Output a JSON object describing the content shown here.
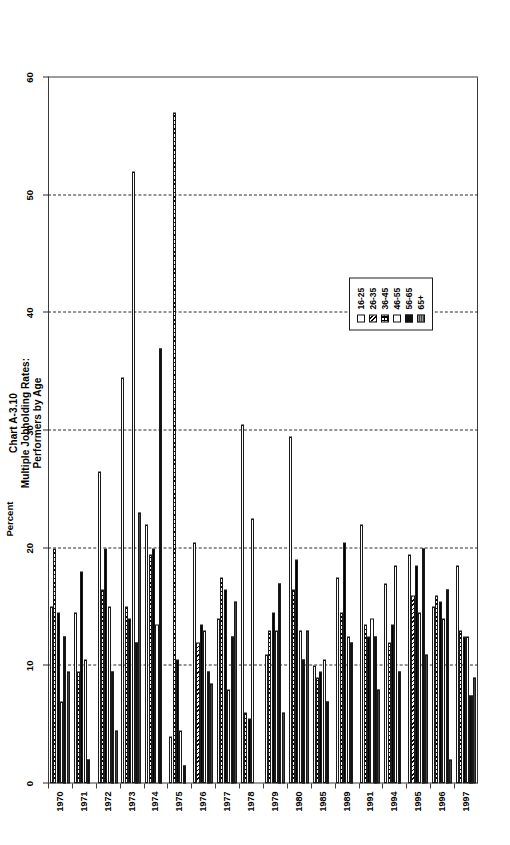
{
  "title": {
    "line1": "Chart A-3.10",
    "line2": "Multiple Jobholding Rates:",
    "line3": "Performers by Age"
  },
  "axis": {
    "label": "Percent",
    "ticks": [
      "0",
      "10",
      "20",
      "30",
      "40",
      "50",
      "60"
    ],
    "min": 0,
    "max": 60,
    "step": 10
  },
  "legend": {
    "items": [
      {
        "label": "16-25",
        "style": "white"
      },
      {
        "label": "26-35",
        "style": "diagonal-hatch"
      },
      {
        "label": "36-45",
        "style": "checker"
      },
      {
        "label": "46-55",
        "style": "open"
      },
      {
        "label": "56-65",
        "style": "solid-black"
      },
      {
        "label": "65+",
        "style": "grey-stipple"
      }
    ]
  },
  "chart_data": {
    "type": "bar",
    "orientation": "horizontal",
    "title": "Chart A-3.10 Multiple Jobholding Rates: Performers by Age",
    "xlabel": "Percent",
    "ylabel": "",
    "xlim": [
      0,
      60
    ],
    "grid": true,
    "legend_position": "inside-lower-right",
    "categories": [
      "1970",
      "1971",
      "1972",
      "1973",
      "1974",
      "1975",
      "1976",
      "1977",
      "1978",
      "1979",
      "1980",
      "1985",
      "1989",
      "1991",
      "1994",
      "1995",
      "1996",
      "1997"
    ],
    "series": [
      {
        "name": "16-25",
        "values": [
          15.0,
          14.5,
          26.5,
          34.5,
          22.0,
          4.0,
          20.5,
          14.0,
          30.5,
          11.0,
          29.5,
          10.0,
          17.5,
          22.0,
          17.0,
          19.5,
          15.0,
          18.5
        ]
      },
      {
        "name": "26-35",
        "values": [
          20.0,
          9.5,
          16.5,
          15.0,
          19.5,
          57.0,
          12.0,
          17.5,
          6.0,
          13.0,
          16.5,
          9.0,
          14.5,
          13.5,
          12.0,
          16.0,
          16.0,
          13.0
        ]
      },
      {
        "name": "36-45",
        "values": [
          14.5,
          18.0,
          20.0,
          14.0,
          20.0,
          10.5,
          13.5,
          16.5,
          5.5,
          14.5,
          19.0,
          9.5,
          20.5,
          12.5,
          13.5,
          18.5,
          15.5,
          12.5
        ]
      },
      {
        "name": "46-55",
        "values": [
          7.0,
          10.5,
          15.0,
          52.0,
          13.5,
          4.5,
          13.0,
          8.0,
          22.5,
          13.0,
          13.0,
          10.5,
          12.5,
          14.0,
          18.5,
          14.5,
          14.0,
          12.5
        ]
      },
      {
        "name": "56-65",
        "values": [
          12.5,
          2.0,
          9.5,
          12.0,
          37.0,
          1.5,
          9.5,
          12.5,
          0.0,
          17.0,
          10.5,
          7.0,
          12.0,
          12.5,
          9.5,
          20.0,
          16.5,
          7.5
        ]
      },
      {
        "name": "65+",
        "values": [
          9.5,
          0.0,
          4.5,
          23.0,
          0.0,
          0.0,
          8.5,
          15.5,
          0.0,
          6.0,
          13.0,
          0.0,
          0.0,
          8.0,
          0.0,
          11.0,
          2.0,
          9.0
        ]
      }
    ]
  }
}
